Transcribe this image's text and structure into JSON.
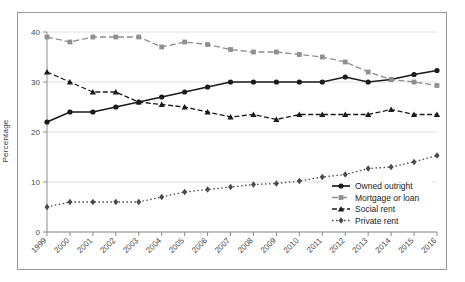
{
  "chart_data": {
    "type": "line",
    "title": "",
    "subtitle": "",
    "xlabel": "",
    "ylabel": "Percentage",
    "x": [
      1999,
      2000,
      2001,
      2002,
      2003,
      2004,
      2005,
      2006,
      2007,
      2008,
      2009,
      2010,
      2011,
      2012,
      2013,
      2014,
      2015,
      2016
    ],
    "categories": [
      "1999",
      "2000",
      "2001",
      "2002",
      "2003",
      "2004",
      "2005",
      "2006",
      "2007",
      "2008",
      "2009",
      "2010",
      "2011",
      "2012",
      "2013",
      "2014",
      "2015",
      "2016"
    ],
    "xlim": [
      1999,
      2016
    ],
    "ylim": [
      0,
      40
    ],
    "yticks": [
      0,
      10,
      20,
      30,
      40
    ],
    "ytick_labels": [
      "0",
      "10",
      "20",
      "30",
      "40"
    ],
    "grid": true,
    "legend_position": "lower right",
    "series": [
      {
        "name": "Owned outright",
        "color": "#1a1a1a",
        "marker": "circle",
        "linestyle": "solid",
        "values": [
          22,
          24,
          24,
          25,
          26,
          27,
          28,
          29,
          30,
          30,
          30,
          30,
          30,
          31,
          30,
          30.5,
          31.5,
          32.3
        ]
      },
      {
        "name": "Mortgage or loan",
        "color": "#8f8f8f",
        "marker": "square",
        "linestyle": "dashed",
        "values": [
          39,
          38,
          39,
          39,
          39,
          37,
          38,
          37.5,
          36.5,
          36,
          36,
          35.5,
          35,
          34,
          32,
          30.5,
          30,
          29.3
        ]
      },
      {
        "name": "Social rent",
        "color": "#1a1a1a",
        "marker": "triangle",
        "linestyle": "dashdot",
        "values": [
          32,
          30,
          28,
          28,
          26,
          25.5,
          25,
          24,
          23,
          23.5,
          22.5,
          23.5,
          23.5,
          23.5,
          23.5,
          24.5,
          23.5,
          23.5
        ]
      },
      {
        "name": "Private rent",
        "color": "#4a4a4a",
        "marker": "diamond",
        "linestyle": "dotted",
        "values": [
          5,
          6,
          6,
          6,
          6,
          7,
          8,
          8.5,
          9,
          9.5,
          9.7,
          10.2,
          11,
          11.5,
          12.7,
          13,
          14,
          15.3
        ]
      }
    ]
  }
}
